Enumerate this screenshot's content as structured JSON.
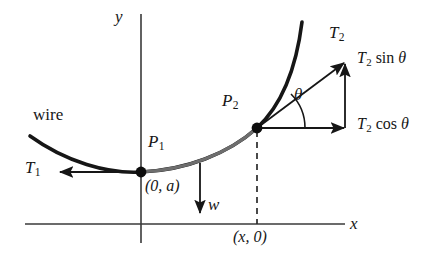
{
  "figure": {
    "type": "physics-force-diagram",
    "background_color": "#ffffff",
    "ink_color": "#161616",
    "curve_light_color": "#6e6e6e"
  },
  "axes": {
    "x_label": "x",
    "y_label": "y",
    "x_axis": {
      "x1": 25,
      "y1": 224,
      "x2": 345,
      "y2": 224
    },
    "y_axis": {
      "x1": 141,
      "y1": 14,
      "x2": 141,
      "y2": 243
    },
    "x_label_pos": {
      "x": 350,
      "y": 218
    },
    "y_label_pos": {
      "x": 116,
      "y": 10
    }
  },
  "curve": {
    "name": "wire",
    "label": "wire",
    "label_pos": {
      "x": 33,
      "y": 110
    },
    "path": "M 30 136 C 66 162 108 174 141 172 C 186 170 228 154 257 128 C 284 103 297 62 302 22",
    "highlight_path": "M 141 172 C 186 170 228 154 257 128",
    "left_end": {
      "x": 30,
      "y": 136
    },
    "right_end": {
      "x": 302,
      "y": 22
    }
  },
  "points": [
    {
      "id": "P1",
      "label": "P",
      "subscript": "1",
      "label_pos": {
        "x": 148,
        "y": 138
      },
      "dot": {
        "x": 141,
        "y": 172,
        "r": 5
      },
      "coordinate_text": "(0, a)",
      "coordinate_pos": {
        "x": 146,
        "y": 180
      }
    },
    {
      "id": "P2",
      "label": "P",
      "subscript": "2",
      "label_pos": {
        "x": 222,
        "y": 96
      },
      "dot": {
        "x": 257,
        "y": 128,
        "r": 5
      },
      "coordinate_text": "(x, 0)",
      "coordinate_pos": {
        "x": 234,
        "y": 232
      }
    }
  ],
  "vectors": [
    {
      "name": "T1",
      "label": "T",
      "subscript": "1",
      "label_pos": {
        "x": 27,
        "y": 163
      },
      "from": {
        "x": 141,
        "y": 172
      },
      "to": {
        "x": 58,
        "y": 172
      },
      "direction": "left",
      "description": "tension at lowest point, horizontal"
    },
    {
      "name": "w",
      "label": "w",
      "label_pos": {
        "x": 209,
        "y": 198
      },
      "from": {
        "x": 200,
        "y": 163
      },
      "to": {
        "x": 200,
        "y": 216
      },
      "direction": "down",
      "description": "weight of wire segment"
    },
    {
      "name": "T2",
      "label": "T",
      "subscript": "2",
      "label_pos": {
        "x": 330,
        "y": 27
      },
      "from": {
        "x": 257,
        "y": 128
      },
      "to": {
        "x": 346,
        "y": 61
      },
      "direction": "up-right",
      "description": "tension at P2 along tangent"
    },
    {
      "name": "T2-sin-theta",
      "label": "T",
      "subscript": "2",
      "trig": "sin",
      "angle": "θ",
      "label_pos": {
        "x": 358,
        "y": 53
      },
      "from": {
        "x": 345,
        "y": 128
      },
      "to": {
        "x": 345,
        "y": 62
      },
      "direction": "up",
      "description": "vertical component of T2"
    },
    {
      "name": "T2-cos-theta",
      "label": "T",
      "subscript": "2",
      "trig": "cos",
      "angle": "θ",
      "label_pos": {
        "x": 358,
        "y": 119
      },
      "from": {
        "x": 257,
        "y": 128
      },
      "to": {
        "x": 347,
        "y": 128
      },
      "direction": "right",
      "description": "horizontal component of T2"
    }
  ],
  "angle": {
    "symbol": "θ",
    "label_pos": {
      "x": 297,
      "y": 95
    },
    "vertex": {
      "x": 257,
      "y": 128
    },
    "arc_radius": 46,
    "arc_path": "M 303 128 A 46 46 0 0 0 289 95"
  },
  "guides": [
    {
      "name": "dashed-drop-line",
      "from": {
        "x": 257,
        "y": 130
      },
      "to": {
        "x": 257,
        "y": 224
      },
      "style": "dashed",
      "dash": "6 5"
    }
  ]
}
